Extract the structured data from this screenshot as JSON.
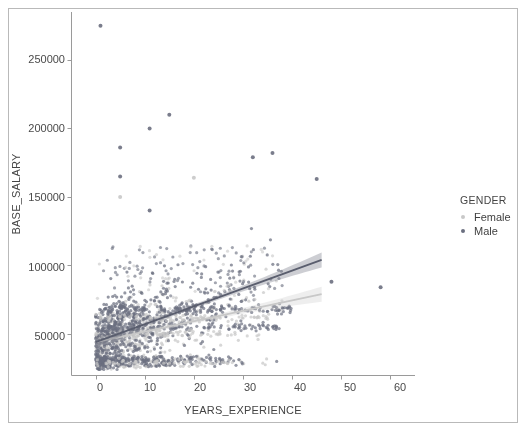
{
  "chart_data": {
    "type": "scatter",
    "title": "",
    "xlabel": "YEARS_EXPERIENCE",
    "ylabel": "BASE_SALARY",
    "xlim": [
      -5,
      65
    ],
    "ylim": [
      20000,
      285000
    ],
    "xticks": [
      0,
      10,
      20,
      30,
      40,
      50,
      60
    ],
    "xtick_labels": [
      "0",
      "10",
      "20",
      "30",
      "40",
      "50",
      "60"
    ],
    "yticks": [
      50000,
      100000,
      150000,
      200000,
      250000
    ],
    "ytick_labels": [
      "50000",
      "100000",
      "150000",
      "200000",
      "250000"
    ],
    "grid": false,
    "legend": {
      "title": "GENDER",
      "position": "right-outside",
      "entries": [
        {
          "label": "Female",
          "color": "#c8c8c8"
        },
        {
          "label": "Male",
          "color": "#6b6f80"
        }
      ]
    },
    "series": [
      {
        "name": "Female",
        "color": "#c8c8c8",
        "marker": "circle",
        "marker_size": 3,
        "regression": {
          "x_start": 0,
          "x_end": 46,
          "y_start": 44000,
          "y_end": 79000,
          "color": "#c8c8c8",
          "band": true
        }
      },
      {
        "name": "Male",
        "color": "#6b6f80",
        "marker": "circle",
        "marker_size": 3,
        "regression": {
          "x_start": 0,
          "x_end": 46,
          "y_start": 44000,
          "y_end": 104000,
          "color": "#5a5e6e",
          "band": true
        }
      }
    ],
    "notable_points": [
      {
        "x": 1,
        "y": 275000,
        "series": "Male"
      },
      {
        "x": 15,
        "y": 210000,
        "series": "Male"
      },
      {
        "x": 11,
        "y": 200000,
        "series": "Male"
      },
      {
        "x": 5,
        "y": 186000,
        "series": "Male"
      },
      {
        "x": 32,
        "y": 179000,
        "series": "Male"
      },
      {
        "x": 36,
        "y": 182000,
        "series": "Male"
      },
      {
        "x": 5,
        "y": 165000,
        "series": "Male"
      },
      {
        "x": 5,
        "y": 150000,
        "series": "Female"
      },
      {
        "x": 20,
        "y": 164000,
        "series": "Female"
      },
      {
        "x": 45,
        "y": 163000,
        "series": "Male"
      },
      {
        "x": 11,
        "y": 140000,
        "series": "Male"
      },
      {
        "x": 48,
        "y": 88000,
        "series": "Male"
      },
      {
        "x": 58,
        "y": 84000,
        "series": "Male"
      }
    ]
  },
  "xticks_px": [
    {
      "label": "0",
      "left": 80,
      "top": 381
    },
    {
      "label": "10",
      "left": 130,
      "top": 381
    },
    {
      "label": "20",
      "left": 180,
      "top": 381
    },
    {
      "label": "30",
      "left": 230,
      "top": 381
    },
    {
      "label": "40",
      "left": 280,
      "top": 381
    },
    {
      "label": "50",
      "left": 330,
      "top": 381
    },
    {
      "label": "60",
      "left": 380,
      "top": 381
    }
  ],
  "yticks_px": [
    {
      "label": "250000",
      "left": 5,
      "top": 53
    },
    {
      "label": "200000",
      "left": 5,
      "top": 122
    },
    {
      "label": "150000",
      "left": 5,
      "top": 191
    },
    {
      "label": "100000",
      "left": 5,
      "top": 261
    },
    {
      "label": "50000",
      "left": 5,
      "top": 330
    }
  ]
}
